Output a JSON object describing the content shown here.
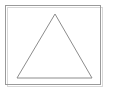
{
  "canvas": {
    "width": 113,
    "height": 94,
    "background_color": "#ffffff",
    "title": "Triangle in frame"
  },
  "frame": {
    "name": "outer-rectangle",
    "x": 5.5,
    "y": 5.5,
    "width": 95,
    "height": 79,
    "stroke_color": "#9a9a9a",
    "stroke_width": 1,
    "fill": "none"
  },
  "shadow": {
    "name": "frame-shadow",
    "visible": true,
    "offset_x": 2,
    "offset_y": 2,
    "color": "#d8d8d8",
    "stroke_width": 1
  },
  "triangle": {
    "name": "isosceles-triangle",
    "apex": {
      "x": 55,
      "y": 14
    },
    "bottom_left": {
      "x": 17,
      "y": 78
    },
    "bottom_right": {
      "x": 92,
      "y": 78
    },
    "points": "55,14 17,78 92,78",
    "stroke_color": "#8c8c8c",
    "stroke_width": 1,
    "fill": "none",
    "base_length": 75,
    "height": 64
  },
  "chart_data": {
    "type": "scatter",
    "title": "Triangle in frame",
    "xlabel": "",
    "ylabel": "",
    "xlim": [
      0,
      113
    ],
    "ylim": [
      0,
      94
    ],
    "grid": false,
    "legend": "none",
    "annotations": [],
    "series": [
      {
        "name": "outer-rectangle",
        "shape": "rectangle",
        "x": [
          5.5,
          100.5,
          100.5,
          5.5,
          5.5
        ],
        "y": [
          5.5,
          5.5,
          84.5,
          84.5,
          5.5
        ],
        "color": "#9a9a9a",
        "fill": "none"
      },
      {
        "name": "isosceles-triangle",
        "shape": "polygon",
        "x": [
          55,
          17,
          92,
          55
        ],
        "y": [
          14,
          78,
          78,
          14
        ],
        "color": "#8c8c8c",
        "fill": "none"
      }
    ]
  }
}
